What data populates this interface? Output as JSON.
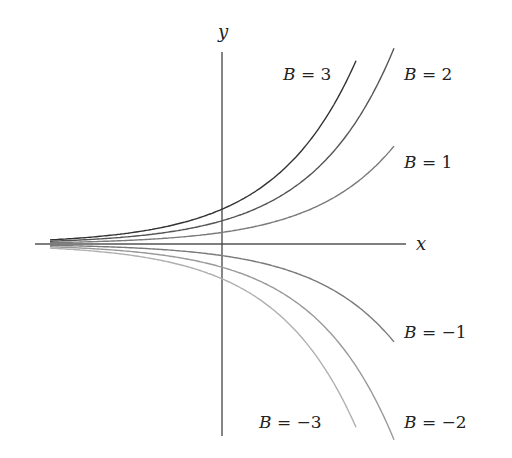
{
  "chart_data": {
    "type": "line",
    "title": "",
    "xlabel": "x",
    "ylabel": "y",
    "function": "y = B e^{x}",
    "grid": false,
    "legend": "inline labels at curve ends",
    "series": [
      {
        "name": "B = 3",
        "B": 3,
        "color": "#333333",
        "label": "B = 3"
      },
      {
        "name": "B = 2",
        "B": 2,
        "color": "#555555",
        "label": "B = 2"
      },
      {
        "name": "B = 1",
        "B": 1,
        "color": "#7a7a7a",
        "label": "B = 1"
      },
      {
        "name": "B = -1",
        "B": -1,
        "color": "#7a7a7a",
        "label": "B = −1"
      },
      {
        "name": "B = -2",
        "B": -2,
        "color": "#999999",
        "label": "B = −2"
      },
      {
        "name": "B = -3",
        "B": -3,
        "color": "#b0b0b0",
        "label": "B = −3"
      }
    ],
    "axes": {
      "x_label": "x",
      "y_label": "y"
    }
  }
}
